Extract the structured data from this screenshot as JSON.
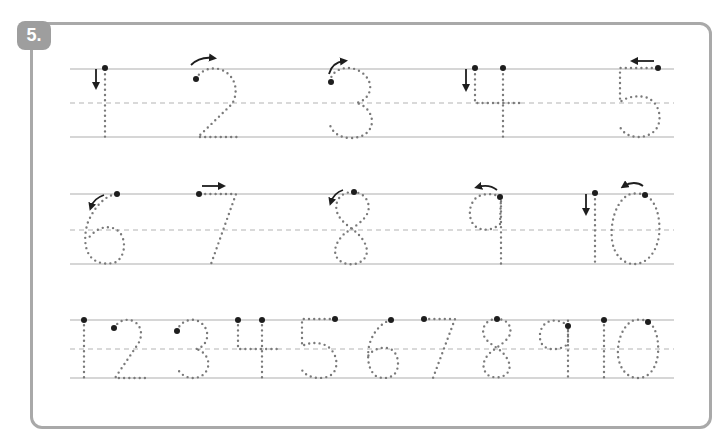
{
  "exercise": {
    "number_label": "5.",
    "type": "number tracing worksheet",
    "colors": {
      "panel_border": "#a9a9a9",
      "badge_fill": "#9e9e9e",
      "trace_dots": "#7a7a7a",
      "start_dot": "#1e1e1e",
      "guide_lines": "#c8c8c8"
    }
  },
  "rows": [
    {
      "name": "row-1",
      "digits": [
        {
          "value": "1",
          "start_arrow": "down"
        },
        {
          "value": "2",
          "start_arrow": "curve-right"
        },
        {
          "value": "3",
          "start_arrow": "curve-right"
        },
        {
          "value": "4",
          "start_arrow": "down"
        },
        {
          "value": "5",
          "start_arrow": "left"
        }
      ]
    },
    {
      "name": "row-2",
      "digits": [
        {
          "value": "6",
          "start_arrow": "curve-left"
        },
        {
          "value": "7",
          "start_arrow": "right"
        },
        {
          "value": "8",
          "start_arrow": "curve-left"
        },
        {
          "value": "9",
          "start_arrow": "curve-left"
        },
        {
          "value": "10",
          "start_arrow": "down / curve-left"
        }
      ]
    },
    {
      "name": "row-3",
      "digits": [
        "1",
        "2",
        "3",
        "4",
        "5",
        "6",
        "7",
        "8",
        "9",
        "10"
      ]
    }
  ]
}
